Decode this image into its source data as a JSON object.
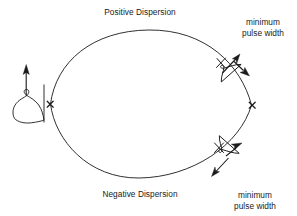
{
  "figure": {
    "background_color": "#ffffff",
    "stroke_color": "#1a1a1a",
    "text_color": "#1a1a1a"
  },
  "labels": {
    "positive_dispersion": "Positive Dispersion",
    "negative_dispersion": "Negative Dispersion",
    "min_pulse_top_line1": "minimum",
    "min_pulse_top_line2": "pulse width",
    "min_pulse_top": "minimum\npulse width",
    "min_pulse_bottom_line1": "minimum",
    "min_pulse_bottom_line2": "pulse width",
    "min_pulse_bottom": "minimum\npulse width"
  },
  "markers": {
    "left_vertex": {
      "symbol": "x",
      "x": 50,
      "y": 104
    },
    "right_vertex": {
      "symbol": "x",
      "x": 252,
      "y": 105
    }
  },
  "shapes": {
    "upper_arc": "positive dispersion branch",
    "lower_arc": "negative dispersion branch",
    "left_pulse": "broad chirped input pulse with vertical reference line and upward arrow",
    "top_right_pulse": "narrow compressed pulse with bidirectional arrows",
    "bottom_right_pulse": "narrow compressed pulse with bidirectional arrows"
  }
}
